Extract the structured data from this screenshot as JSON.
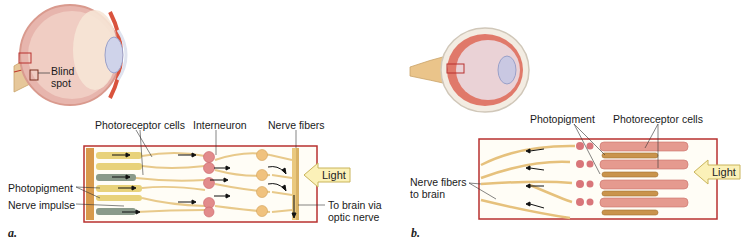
{
  "panel_a": {
    "letter": "a.",
    "labels": {
      "blind_spot_line1": "Blind",
      "blind_spot_line2": "spot",
      "photoreceptor_cells": "Photoreceptor cells",
      "interneuron": "Interneuron",
      "nerve_fibers": "Nerve fibers",
      "photopigment": "Photopigment",
      "nerve_impulse": "Nerve impulse",
      "to_brain_line1": "To brain via",
      "to_brain_line2": "optic nerve",
      "light": "Light"
    }
  },
  "panel_b": {
    "letter": "b.",
    "labels": {
      "photopigment": "Photopigment",
      "photoreceptor_cells": "Photoreceptor cells",
      "nerve_fibers_line1": "Nerve fibers",
      "nerve_fibers_line2": "to brain",
      "light": "Light"
    }
  },
  "colors": {
    "frame_border": "#b8312f",
    "light_arrow_fill": "#fbf1b8",
    "light_arrow_stroke": "#c9b45a",
    "nerve": "#e8c98a",
    "receptor_pink": "#e59a8f",
    "eye_pink": "#e8b4b0"
  }
}
